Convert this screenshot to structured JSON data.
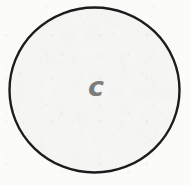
{
  "figure": {
    "kind": "geometric-shape-sketch",
    "canvas": {
      "width": 191,
      "height": 185,
      "background_color": "#fbfbfa",
      "texture": "paper-grain"
    },
    "shape": {
      "name": "circle",
      "icon_name": "circle-outline-icon",
      "center_x": 94.5,
      "center_y": 90,
      "radius_x": 85,
      "radius_y": 82,
      "stroke_color": "#1c1c1c",
      "stroke_width": 2.4,
      "fill_color": "#f7f7f6",
      "style": "hand-drawn"
    },
    "label": {
      "text": "c",
      "color": "#7c7c7c",
      "font_size_px": 27,
      "font_style": "italic",
      "font_weight": "bold",
      "center_x": 96,
      "center_y": 86
    }
  }
}
